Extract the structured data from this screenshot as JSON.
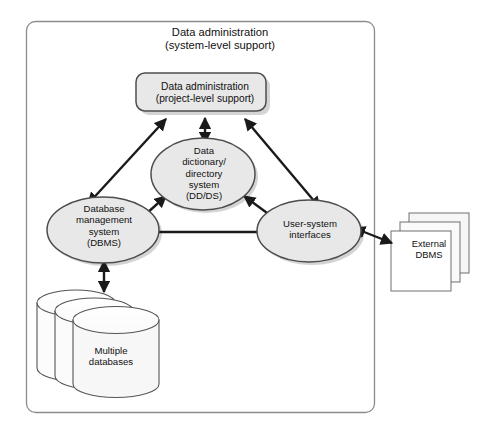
{
  "diagram": {
    "title": "Data administration (system-level support)",
    "outer_boundary_name": "Data administration (system-level support)",
    "system_level_title": "Data administration\n(system-level support)",
    "nodes": {
      "project_admin": {
        "label": "Data administration\n(project-level support)",
        "shape": "rounded-rectangle",
        "fill": "#e8e8e8",
        "stroke": "#4d4d4d"
      },
      "data_dictionary": {
        "label": "Data\ndictionary/\ndirectory\nsystem\n(DD/DS)",
        "shape": "ellipse",
        "fill": "#e8e8e8",
        "stroke": "#4d4d4d"
      },
      "dbms": {
        "label": "Database\nmanagement\nsystem\n(DBMS)",
        "shape": "ellipse",
        "fill": "#e8e8e8",
        "stroke": "#4d4d4d"
      },
      "user_system_interfaces": {
        "label": "User-system\ninterfaces",
        "shape": "ellipse",
        "fill": "#e8e8e8",
        "stroke": "#4d4d4d"
      },
      "multiple_databases": {
        "label": "Multiple\ndatabases",
        "shape": "stacked-cylinders",
        "count": 3,
        "fill": "#f2f2f2",
        "stroke": "#555555"
      },
      "external_dbms": {
        "label": "External\nDBMS",
        "shape": "stacked-squares",
        "count": 3,
        "fill": "#ffffff",
        "stroke": "#6e6e6e"
      }
    },
    "connectors": [
      {
        "from": "dbms",
        "to": "project_admin",
        "arrows": "both"
      },
      {
        "from": "data_dictionary",
        "to": "project_admin",
        "arrows": "both"
      },
      {
        "from": "user_system_interfaces",
        "to": "project_admin",
        "arrows": "both"
      },
      {
        "from": "dbms",
        "to": "data_dictionary",
        "arrows": "both"
      },
      {
        "from": "data_dictionary",
        "to": "user_system_interfaces",
        "arrows": "both"
      },
      {
        "from": "dbms",
        "to": "user_system_interfaces",
        "arrows": "both"
      },
      {
        "from": "dbms",
        "to": "multiple_databases",
        "arrows": "both"
      },
      {
        "from": "user_system_interfaces",
        "to": "external_dbms",
        "arrows": "both"
      }
    ],
    "colors": {
      "node_fill": "#e8e8e8",
      "node_stroke": "#4d4d4d",
      "arrow": "#1a1a1a",
      "boundary_stroke": "#8c8c8c",
      "background": "#ffffff",
      "text": "#111111"
    }
  }
}
